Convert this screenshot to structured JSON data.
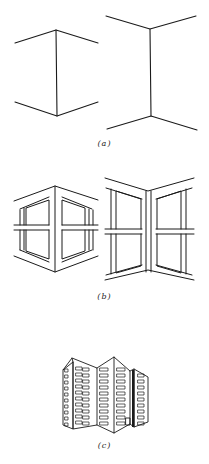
{
  "figure": {
    "parts": [
      {
        "id": "a",
        "label": "(a)",
        "description": "Two line drawings of corner edges: a convex (outward) corner and a concave (inward) corner"
      },
      {
        "id": "b",
        "label": "(b)",
        "description": "The same corners with window frames added: convex corner with windows and concave corner with windows"
      },
      {
        "id": "c",
        "label": "(c)",
        "description": "Line drawing of a tall apartment building with a folded facade and rows of windows"
      }
    ]
  },
  "colors": {
    "ink": "#1a1a1a",
    "background": "#ffffff"
  }
}
